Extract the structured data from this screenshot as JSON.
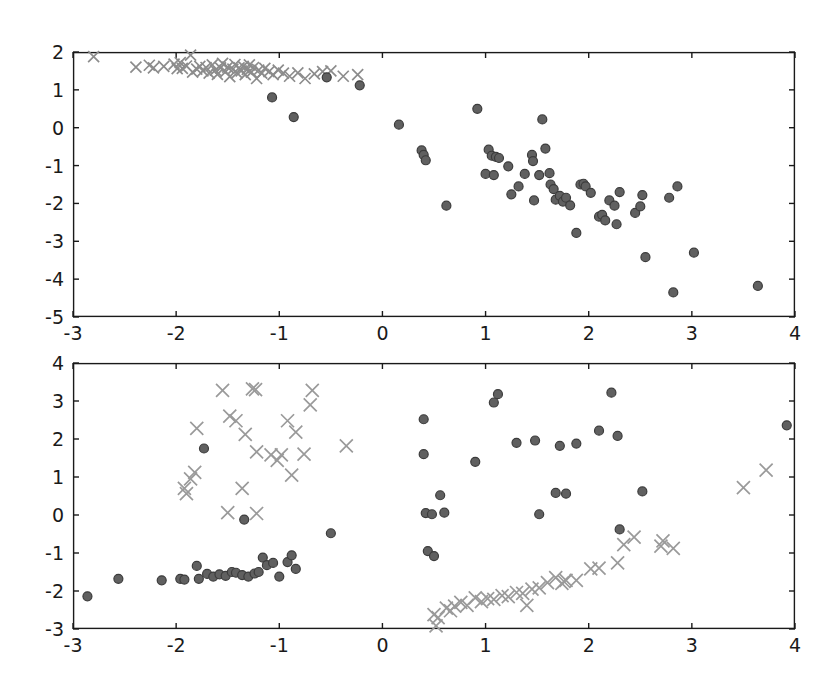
{
  "figure": {
    "width": 831,
    "height": 689,
    "background": "#ffffff",
    "axis_color": "#1a1a1a",
    "tick_label_color": "#1a1a1a",
    "tick_font_size": 19
  },
  "chart_data": [
    {
      "id": "top-panel",
      "type": "scatter",
      "title": "",
      "xlabel": "",
      "ylabel": "",
      "xlim": [
        -3,
        4
      ],
      "ylim": [
        -5,
        2
      ],
      "xticks": [
        -3,
        -2,
        -1,
        0,
        1,
        2,
        3,
        4
      ],
      "yticks": [
        -5,
        -4,
        -3,
        -2,
        -1,
        0,
        1,
        2
      ],
      "xticklabels": [
        "-3",
        "-2",
        "-1",
        "0",
        "1",
        "2",
        "3",
        "4"
      ],
      "yticklabels": [
        "-5",
        "-4",
        "-3",
        "-2",
        "-1",
        "0",
        "1",
        "2"
      ],
      "grid": false,
      "legend": null,
      "series": [
        {
          "name": "cross-markers",
          "marker": "x",
          "color": "#8c8c8c",
          "size": 11,
          "points": [
            [
              -2.8,
              1.88
            ],
            [
              -2.39,
              1.6
            ],
            [
              -2.26,
              1.65
            ],
            [
              -2.22,
              1.58
            ],
            [
              -2.12,
              1.62
            ],
            [
              -2.02,
              1.68
            ],
            [
              -1.99,
              1.56
            ],
            [
              -1.96,
              1.72
            ],
            [
              -1.94,
              1.57
            ],
            [
              -1.9,
              1.63
            ],
            [
              -1.86,
              1.92
            ],
            [
              -1.84,
              1.47
            ],
            [
              -1.8,
              1.55
            ],
            [
              -1.77,
              1.62
            ],
            [
              -1.74,
              1.5
            ],
            [
              -1.71,
              1.59
            ],
            [
              -1.68,
              1.44
            ],
            [
              -1.65,
              1.66
            ],
            [
              -1.62,
              1.52
            ],
            [
              -1.6,
              1.41
            ],
            [
              -1.57,
              1.58
            ],
            [
              -1.55,
              1.7
            ],
            [
              -1.52,
              1.48
            ],
            [
              -1.5,
              1.6
            ],
            [
              -1.48,
              1.35
            ],
            [
              -1.45,
              1.55
            ],
            [
              -1.43,
              1.67
            ],
            [
              -1.41,
              1.45
            ],
            [
              -1.39,
              1.58
            ],
            [
              -1.37,
              1.5
            ],
            [
              -1.35,
              1.62
            ],
            [
              -1.33,
              1.4
            ],
            [
              -1.31,
              1.54
            ],
            [
              -1.29,
              1.66
            ],
            [
              -1.27,
              1.47
            ],
            [
              -1.25,
              1.59
            ],
            [
              -1.22,
              1.3
            ],
            [
              -1.2,
              1.52
            ],
            [
              -1.17,
              1.44
            ],
            [
              -1.14,
              1.57
            ],
            [
              -1.1,
              1.48
            ],
            [
              -1.06,
              1.4
            ],
            [
              -1.01,
              1.52
            ],
            [
              -0.96,
              1.44
            ],
            [
              -0.9,
              1.36
            ],
            [
              -0.82,
              1.45
            ],
            [
              -0.75,
              1.3
            ],
            [
              -0.66,
              1.42
            ],
            [
              -0.58,
              1.48
            ],
            [
              -0.5,
              1.5
            ],
            [
              -0.38,
              1.36
            ],
            [
              -0.24,
              1.4
            ]
          ]
        },
        {
          "name": "circle-markers",
          "marker": "o",
          "color": "#606060",
          "edge": "#3c3c3c",
          "size": 9,
          "points": [
            [
              -1.07,
              0.8
            ],
            [
              -0.86,
              0.28
            ],
            [
              -0.54,
              1.33
            ],
            [
              -0.22,
              1.12
            ],
            [
              0.16,
              0.08
            ],
            [
              0.38,
              -0.6
            ],
            [
              0.4,
              -0.72
            ],
            [
              0.42,
              -0.86
            ],
            [
              0.62,
              -2.06
            ],
            [
              0.92,
              0.5
            ],
            [
              1.03,
              -0.58
            ],
            [
              1.06,
              -0.74
            ],
            [
              1.1,
              -0.77
            ],
            [
              1.13,
              -0.8
            ],
            [
              1.0,
              -1.22
            ],
            [
              1.08,
              -1.25
            ],
            [
              1.22,
              -1.02
            ],
            [
              1.25,
              -1.76
            ],
            [
              1.32,
              -1.55
            ],
            [
              1.38,
              -1.22
            ],
            [
              1.45,
              -0.72
            ],
            [
              1.46,
              -0.88
            ],
            [
              1.47,
              -1.92
            ],
            [
              1.52,
              -1.25
            ],
            [
              1.55,
              0.22
            ],
            [
              1.58,
              -0.55
            ],
            [
              1.62,
              -1.2
            ],
            [
              1.63,
              -1.5
            ],
            [
              1.66,
              -1.62
            ],
            [
              1.68,
              -1.9
            ],
            [
              1.72,
              -1.8
            ],
            [
              1.75,
              -1.95
            ],
            [
              1.78,
              -1.85
            ],
            [
              1.82,
              -2.05
            ],
            [
              1.88,
              -2.78
            ],
            [
              1.92,
              -1.5
            ],
            [
              1.95,
              -1.48
            ],
            [
              1.97,
              -1.55
            ],
            [
              2.02,
              -1.72
            ],
            [
              2.1,
              -2.35
            ],
            [
              2.13,
              -2.3
            ],
            [
              2.16,
              -2.45
            ],
            [
              2.2,
              -1.92
            ],
            [
              2.25,
              -2.06
            ],
            [
              2.27,
              -2.55
            ],
            [
              2.3,
              -1.7
            ],
            [
              2.45,
              -2.25
            ],
            [
              2.5,
              -2.08
            ],
            [
              2.52,
              -1.78
            ],
            [
              2.55,
              -3.42
            ],
            [
              2.78,
              -1.85
            ],
            [
              2.82,
              -4.35
            ],
            [
              2.86,
              -1.55
            ],
            [
              3.02,
              -3.3
            ],
            [
              3.64,
              -4.18
            ]
          ]
        }
      ]
    },
    {
      "id": "bottom-panel",
      "type": "scatter",
      "title": "",
      "xlabel": "",
      "ylabel": "",
      "xlim": [
        -3,
        4
      ],
      "ylim": [
        -3,
        4
      ],
      "xticks": [
        -3,
        -2,
        -1,
        0,
        1,
        2,
        3,
        4
      ],
      "yticks": [
        -3,
        -2,
        -1,
        0,
        1,
        2,
        3,
        4
      ],
      "xticklabels": [
        "-3",
        "-2",
        "-1",
        "0",
        "1",
        "2",
        "3",
        "4"
      ],
      "yticklabels": [
        "-3",
        "-2",
        "-1",
        "0",
        "1",
        "2",
        "3",
        "4"
      ],
      "grid": false,
      "legend": null,
      "series": [
        {
          "name": "cross-markers",
          "marker": "x",
          "color": "#9a9a9a",
          "size": 13,
          "points": [
            [
              -1.55,
              3.28
            ],
            [
              -1.26,
              3.32
            ],
            [
              -1.23,
              3.3
            ],
            [
              -0.68,
              3.28
            ],
            [
              -0.7,
              2.9
            ],
            [
              -1.48,
              2.6
            ],
            [
              -1.42,
              2.48
            ],
            [
              -1.8,
              2.28
            ],
            [
              -1.33,
              2.12
            ],
            [
              -0.92,
              2.48
            ],
            [
              -0.84,
              2.18
            ],
            [
              -1.22,
              1.66
            ],
            [
              -1.08,
              1.58
            ],
            [
              -1.02,
              1.44
            ],
            [
              -0.98,
              1.58
            ],
            [
              -0.76,
              1.6
            ],
            [
              -0.35,
              1.82
            ],
            [
              -0.88,
              1.05
            ],
            [
              -1.82,
              1.12
            ],
            [
              -1.86,
              0.95
            ],
            [
              -1.92,
              0.7
            ],
            [
              -1.9,
              0.56
            ],
            [
              -1.36,
              0.7
            ],
            [
              -1.5,
              0.06
            ],
            [
              -1.22,
              0.04
            ],
            [
              0.52,
              -2.92
            ],
            [
              0.54,
              -2.7
            ],
            [
              0.5,
              -2.62
            ],
            [
              0.62,
              -2.45
            ],
            [
              0.66,
              -2.52
            ],
            [
              0.7,
              -2.4
            ],
            [
              0.76,
              -2.3
            ],
            [
              0.82,
              -2.38
            ],
            [
              0.9,
              -2.18
            ],
            [
              0.96,
              -2.28
            ],
            [
              1.02,
              -2.2
            ],
            [
              1.08,
              -2.22
            ],
            [
              1.16,
              -2.12
            ],
            [
              1.22,
              -2.15
            ],
            [
              1.3,
              -2.04
            ],
            [
              1.36,
              -2.06
            ],
            [
              1.4,
              -2.38
            ],
            [
              1.45,
              -1.95
            ],
            [
              1.52,
              -1.92
            ],
            [
              1.6,
              -1.78
            ],
            [
              1.68,
              -1.65
            ],
            [
              1.74,
              -1.8
            ],
            [
              1.76,
              -1.75
            ],
            [
              1.78,
              -1.72
            ],
            [
              1.88,
              -1.72
            ],
            [
              2.02,
              -1.42
            ],
            [
              2.1,
              -1.4
            ],
            [
              2.28,
              -1.26
            ],
            [
              2.34,
              -0.78
            ],
            [
              2.44,
              -0.58
            ],
            [
              2.7,
              -0.82
            ],
            [
              2.72,
              -0.68
            ],
            [
              2.82,
              -0.88
            ],
            [
              3.5,
              0.72
            ],
            [
              3.72,
              1.18
            ]
          ]
        },
        {
          "name": "circle-markers",
          "marker": "o",
          "color": "#606060",
          "edge": "#3c3c3c",
          "size": 9,
          "points": [
            [
              -2.86,
              -2.14
            ],
            [
              -2.56,
              -1.68
            ],
            [
              -2.14,
              -1.72
            ],
            [
              -1.96,
              -1.68
            ],
            [
              -1.92,
              -1.7
            ],
            [
              -1.8,
              -1.34
            ],
            [
              -1.78,
              -1.68
            ],
            [
              -1.73,
              1.75
            ],
            [
              -1.7,
              -1.55
            ],
            [
              -1.64,
              -1.62
            ],
            [
              -1.58,
              -1.56
            ],
            [
              -1.52,
              -1.6
            ],
            [
              -1.46,
              -1.5
            ],
            [
              -1.42,
              -1.52
            ],
            [
              -1.36,
              -1.58
            ],
            [
              -1.34,
              -0.12
            ],
            [
              -1.3,
              -1.62
            ],
            [
              -1.24,
              -1.54
            ],
            [
              -1.2,
              -1.5
            ],
            [
              -1.16,
              -1.12
            ],
            [
              -1.12,
              -1.32
            ],
            [
              -1.06,
              -1.26
            ],
            [
              -1.0,
              -1.62
            ],
            [
              -0.92,
              -1.24
            ],
            [
              -0.88,
              -1.06
            ],
            [
              -0.84,
              -1.42
            ],
            [
              -0.5,
              -0.48
            ],
            [
              0.4,
              2.52
            ],
            [
              0.4,
              1.6
            ],
            [
              0.42,
              0.05
            ],
            [
              0.44,
              -0.95
            ],
            [
              0.48,
              0.02
            ],
            [
              0.5,
              -1.08
            ],
            [
              0.56,
              0.52
            ],
            [
              0.6,
              0.06
            ],
            [
              0.9,
              1.4
            ],
            [
              1.08,
              2.96
            ],
            [
              1.12,
              3.18
            ],
            [
              1.3,
              1.9
            ],
            [
              1.48,
              1.96
            ],
            [
              1.52,
              0.02
            ],
            [
              1.68,
              0.58
            ],
            [
              1.72,
              1.82
            ],
            [
              1.78,
              0.56
            ],
            [
              1.88,
              1.88
            ],
            [
              2.1,
              2.22
            ],
            [
              2.22,
              3.22
            ],
            [
              2.28,
              2.08
            ],
            [
              2.3,
              -0.38
            ],
            [
              2.52,
              0.62
            ],
            [
              3.92,
              2.36
            ]
          ]
        }
      ]
    }
  ]
}
